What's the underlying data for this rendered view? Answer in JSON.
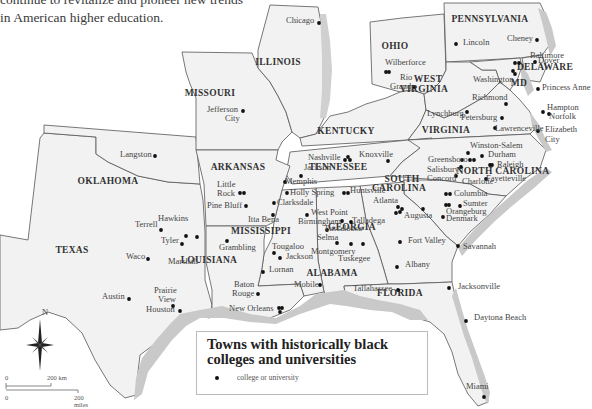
{
  "intro_text": {
    "line1": "continue to revitalize and pioneer new trends",
    "line2": "in American higher education."
  },
  "legend": {
    "title": "Towns with historically black colleges and universities",
    "item_label": "college or university"
  },
  "scale_bar": {
    "km_zero": "0",
    "km_label": "200 km",
    "mi_zero": "0",
    "mi_label": "200 miles"
  },
  "compass": {
    "north_label": "N"
  },
  "states": [
    {
      "name": "PENNSYLVANIA",
      "x": 490,
      "y": 22
    },
    {
      "name": "OHIO",
      "x": 395,
      "y": 49
    },
    {
      "name": "ILLINOIS",
      "x": 278,
      "y": 65
    },
    {
      "name": "MISSOURI",
      "x": 210,
      "y": 96
    },
    {
      "name": "WEST",
      "x": 428,
      "y": 82
    },
    {
      "name": "VIRGINIA",
      "x": 424,
      "y": 92
    },
    {
      "name": "DELAWARE",
      "x": 545,
      "y": 70
    },
    {
      "name": "MD",
      "x": 519,
      "y": 86
    },
    {
      "name": "KENTUCKY",
      "x": 346,
      "y": 134
    },
    {
      "name": "VIRGINIA",
      "x": 446,
      "y": 133
    },
    {
      "name": "TENNESSEE",
      "x": 338,
      "y": 170
    },
    {
      "name": "ARKANSAS",
      "x": 238,
      "y": 170
    },
    {
      "name": "OKLAHOMA",
      "x": 108,
      "y": 184
    },
    {
      "name": "NORTH CAROLINA",
      "x": 503,
      "y": 174
    },
    {
      "name": "SOUTH",
      "x": 402,
      "y": 182
    },
    {
      "name": "CAROLINA",
      "x": 399,
      "y": 191
    },
    {
      "name": "GEORGIA",
      "x": 352,
      "y": 230
    },
    {
      "name": "MISSISSIPPI",
      "x": 261,
      "y": 234
    },
    {
      "name": "TEXAS",
      "x": 72,
      "y": 253
    },
    {
      "name": "LOUISIANA",
      "x": 209,
      "y": 263
    },
    {
      "name": "ALABAMA",
      "x": 332,
      "y": 276
    },
    {
      "name": "FLORIDA",
      "x": 400,
      "y": 296
    }
  ],
  "cities": [
    {
      "name": "Chicago",
      "x": 286,
      "y": 23,
      "dots": [
        [
          319,
          23
        ]
      ]
    },
    {
      "name": "Lincoln",
      "x": 463,
      "y": 45,
      "dots": [
        [
          456,
          44
        ]
      ]
    },
    {
      "name": "Cheney",
      "x": 507,
      "y": 41,
      "dots": [
        [
          537,
          40
        ]
      ]
    },
    {
      "name": "Wilberforce",
      "x": 385,
      "y": 65,
      "dots": [
        [
          386,
          72
        ],
        [
          389,
          72
        ]
      ]
    },
    {
      "name": "Rio",
      "x": 400,
      "y": 80,
      "dots": []
    },
    {
      "name": "Grande",
      "x": 390,
      "y": 89,
      "dots": [
        [
          414,
          87
        ]
      ]
    },
    {
      "name": "Baltimore",
      "x": 530,
      "y": 58,
      "dots": [
        [
          515,
          63
        ],
        [
          519,
          63
        ]
      ]
    },
    {
      "name": "Dover",
      "x": 538,
      "y": 63,
      "dots": [
        [
          535,
          62
        ]
      ]
    },
    {
      "name": "Washington",
      "x": 473,
      "y": 82,
      "dots": [
        [
          513,
          71
        ],
        [
          515,
          74
        ]
      ]
    },
    {
      "name": "Princess Anne",
      "x": 542,
      "y": 90,
      "dots": [
        [
          538,
          89
        ]
      ]
    },
    {
      "name": "Jefferson",
      "x": 207,
      "y": 112,
      "dots": [
        [
          243,
          111
        ]
      ]
    },
    {
      "name": "City",
      "x": 225,
      "y": 121,
      "dots": []
    },
    {
      "name": "Richmond",
      "x": 472,
      "y": 100,
      "dots": [
        [
          506,
          104
        ]
      ]
    },
    {
      "name": "Hampton",
      "x": 547,
      "y": 110,
      "dots": [
        [
          543,
          112
        ]
      ]
    },
    {
      "name": "Norfolk",
      "x": 549,
      "y": 119,
      "dots": [
        [
          549,
          114
        ]
      ]
    },
    {
      "name": "Lynchburg",
      "x": 427,
      "y": 116,
      "dots": [
        [
          467,
          112
        ]
      ]
    },
    {
      "name": "Petersburg",
      "x": 461,
      "y": 120,
      "dots": [
        [
          502,
          118
        ]
      ]
    },
    {
      "name": "Lawrenceville",
      "x": 495,
      "y": 131,
      "dots": [
        [
          495,
          128
        ]
      ]
    },
    {
      "name": "Elizabeth",
      "x": 545,
      "y": 132,
      "dots": [
        [
          538,
          131
        ]
      ]
    },
    {
      "name": "City",
      "x": 545,
      "y": 142,
      "dots": []
    },
    {
      "name": "Langston",
      "x": 120,
      "y": 157,
      "dots": [
        [
          155,
          156
        ]
      ]
    },
    {
      "name": "Nashville",
      "x": 308,
      "y": 160,
      "dots": [
        [
          348,
          157
        ],
        [
          345,
          160
        ],
        [
          350,
          160
        ]
      ]
    },
    {
      "name": "Knoxville",
      "x": 359,
      "y": 157,
      "dots": [
        [
          388,
          161
        ]
      ]
    },
    {
      "name": "Winston-Salem",
      "x": 470,
      "y": 148,
      "dots": [
        [
          468,
          153
        ]
      ]
    },
    {
      "name": "Greensboro",
      "x": 428,
      "y": 162,
      "dots": [
        [
          470,
          160
        ],
        [
          474,
          160
        ]
      ]
    },
    {
      "name": "Durham",
      "x": 488,
      "y": 157,
      "dots": [
        [
          482,
          156
        ]
      ]
    },
    {
      "name": "Jackson",
      "x": 304,
      "y": 170,
      "dots": [
        [
          301,
          176
        ]
      ]
    },
    {
      "name": "Salisbury",
      "x": 427,
      "y": 172,
      "dots": [
        [
          462,
          160
        ]
      ]
    },
    {
      "name": "Raleigh",
      "x": 497,
      "y": 167,
      "dots": [
        [
          490,
          165
        ],
        [
          492,
          165
        ]
      ]
    },
    {
      "name": "Concord",
      "x": 427,
      "y": 181,
      "dots": [
        [
          461,
          167
        ]
      ]
    },
    {
      "name": "Charlotte",
      "x": 462,
      "y": 184,
      "dots": [
        [
          456,
          176
        ]
      ]
    },
    {
      "name": "Fayetteville",
      "x": 486,
      "y": 181,
      "dots": [
        [
          486,
          179
        ]
      ]
    },
    {
      "name": "Memphis",
      "x": 285,
      "y": 184,
      "dots": [
        [
          285,
          182
        ]
      ]
    },
    {
      "name": "Little",
      "x": 217,
      "y": 187,
      "dots": []
    },
    {
      "name": "Rock",
      "x": 217,
      "y": 196,
      "dots": [
        [
          240,
          193
        ],
        [
          244,
          193
        ]
      ]
    },
    {
      "name": "Holly Spring",
      "x": 290,
      "y": 195,
      "dots": [
        [
          287,
          193
        ]
      ]
    },
    {
      "name": "Huntsville",
      "x": 350,
      "y": 193,
      "dots": [
        [
          344,
          193
        ],
        [
          348,
          193
        ]
      ]
    },
    {
      "name": "Columbia",
      "x": 454,
      "y": 196,
      "dots": [
        [
          446,
          194
        ],
        [
          450,
          194
        ]
      ]
    },
    {
      "name": "Atlanta",
      "x": 373,
      "y": 203,
      "dots": [
        [
          398,
          207
        ],
        [
          402,
          209
        ],
        [
          400,
          212
        ],
        [
          396,
          213
        ]
      ]
    },
    {
      "name": "Clarksdale",
      "x": 277,
      "y": 205,
      "dots": [
        [
          274,
          203
        ]
      ]
    },
    {
      "name": "Sumter",
      "x": 463,
      "y": 206,
      "dots": [
        [
          460,
          206
        ]
      ]
    },
    {
      "name": "Pine Bluff",
      "x": 207,
      "y": 208,
      "dots": [
        [
          246,
          206
        ]
      ]
    },
    {
      "name": "Augusta",
      "x": 404,
      "y": 218,
      "dots": [
        [
          423,
          209
        ]
      ]
    },
    {
      "name": "Orangeburg",
      "x": 446,
      "y": 214,
      "dots": [
        [
          446,
          205
        ],
        [
          449,
          205
        ]
      ]
    },
    {
      "name": "West Point",
      "x": 311,
      "y": 215,
      "dots": [
        [
          307,
          215
        ]
      ]
    },
    {
      "name": "Birmingham",
      "x": 298,
      "y": 224,
      "dots": [
        [
          342,
          221
        ]
      ]
    },
    {
      "name": "Talladega",
      "x": 352,
      "y": 223,
      "dots": [
        [
          351,
          222
        ]
      ]
    },
    {
      "name": "Denmark",
      "x": 446,
      "y": 221,
      "dots": [
        [
          443,
          217
        ]
      ]
    },
    {
      "name": "Itta Bena",
      "x": 248,
      "y": 222,
      "dots": [
        [
          273,
          215
        ]
      ]
    },
    {
      "name": "Hawkins",
      "x": 158,
      "y": 221,
      "dots": [
        [
          186,
          236
        ]
      ]
    },
    {
      "name": "Terrell",
      "x": 135,
      "y": 227,
      "dots": [
        [
          161,
          230
        ]
      ]
    },
    {
      "name": "Tuscaloosa",
      "x": 324,
      "y": 231,
      "dots": [
        [
          327,
          230
        ]
      ]
    },
    {
      "name": "Tyler",
      "x": 161,
      "y": 243,
      "dots": [
        [
          182,
          244
        ]
      ]
    },
    {
      "name": "Selma",
      "x": 317,
      "y": 240,
      "dots": [
        [
          337,
          243
        ]
      ]
    },
    {
      "name": "Fort Valley",
      "x": 408,
      "y": 243,
      "dots": [
        [
          400,
          242
        ]
      ]
    },
    {
      "name": "Tougaloo",
      "x": 272,
      "y": 249,
      "dots": [
        [
          274,
          253
        ]
      ]
    },
    {
      "name": "Montgomery",
      "x": 311,
      "y": 254,
      "dots": [
        [
          351,
          244
        ]
      ]
    },
    {
      "name": "Marshall",
      "x": 168,
      "y": 264,
      "dots": [
        [
          197,
          237
        ]
      ]
    },
    {
      "name": "Waco",
      "x": 126,
      "y": 259,
      "dots": [
        [
          148,
          259
        ]
      ]
    },
    {
      "name": "Grambling",
      "x": 219,
      "y": 250,
      "dots": [
        [
          227,
          241
        ]
      ]
    },
    {
      "name": "Jackson",
      "x": 286,
      "y": 259,
      "dots": [
        [
          280,
          258
        ]
      ]
    },
    {
      "name": "Tuskegee",
      "x": 338,
      "y": 261,
      "dots": [
        [
          363,
          244
        ]
      ]
    },
    {
      "name": "Savannah",
      "x": 463,
      "y": 249,
      "dots": [
        [
          458,
          246
        ]
      ]
    },
    {
      "name": "Lornan",
      "x": 269,
      "y": 272,
      "dots": [
        [
          263,
          272
        ]
      ]
    },
    {
      "name": "Albany",
      "x": 405,
      "y": 267,
      "dots": [
        [
          397,
          267
        ]
      ]
    },
    {
      "name": "Austin",
      "x": 102,
      "y": 299,
      "dots": [
        [
          129,
          299
        ]
      ]
    },
    {
      "name": "Prairie",
      "x": 154,
      "y": 293,
      "dots": []
    },
    {
      "name": "View",
      "x": 158,
      "y": 302,
      "dots": [
        [
          173,
          306
        ]
      ]
    },
    {
      "name": "Baton",
      "x": 234,
      "y": 287,
      "dots": []
    },
    {
      "name": "Rouge",
      "x": 232,
      "y": 296,
      "dots": [
        [
          258,
          294
        ]
      ]
    },
    {
      "name": "Mobile",
      "x": 294,
      "y": 287,
      "dots": [
        [
          320,
          285
        ]
      ]
    },
    {
      "name": "Tallahassee",
      "x": 353,
      "y": 291,
      "dots": [
        [
          398,
          290
        ]
      ]
    },
    {
      "name": "Jacksonville",
      "x": 458,
      "y": 289,
      "dots": [
        [
          449,
          288
        ]
      ]
    },
    {
      "name": "Houston",
      "x": 146,
      "y": 312,
      "dots": [
        [
          180,
          311
        ]
      ]
    },
    {
      "name": "New Orleans",
      "x": 229,
      "y": 311,
      "dots": [
        [
          279,
          308
        ],
        [
          282,
          308
        ],
        [
          280,
          312
        ]
      ]
    },
    {
      "name": "Daytona Beach",
      "x": 474,
      "y": 320,
      "dots": [
        [
          466,
          321
        ]
      ]
    },
    {
      "name": "Miami",
      "x": 466,
      "y": 389,
      "dots": [
        [
          484,
          397
        ]
      ]
    }
  ]
}
